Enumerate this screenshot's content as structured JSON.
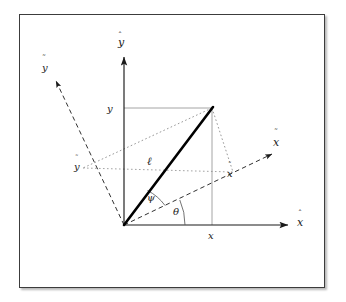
{
  "figure": {
    "type": "vector-diagram",
    "background_color": "#ffffff",
    "frame_border_color": "#3c3c3c",
    "axis_color": "#1a1a1a",
    "vector_color": "#000000",
    "projection_color": "#8a8a8a",
    "labels": {
      "axis_x_hat": "x",
      "axis_y_hat": "y",
      "axis_x_tilde": "x",
      "axis_y_tilde": "y",
      "component_x": "x",
      "component_y": "y",
      "component_x_tilde": "x",
      "component_y_tilde": "y",
      "vector_length": "ℓ",
      "angle_theta": "θ",
      "angle_psi": "ψ",
      "hat_accent": "ˆ",
      "tilde_accent": "˜"
    },
    "geometry": {
      "origin": [
        124,
        225
      ],
      "point_p": [
        212,
        108
      ],
      "x_hat_axis_tip": [
        292,
        225
      ],
      "y_hat_axis_tip": [
        124,
        52
      ],
      "x_tilde_axis_tip": [
        277,
        150
      ],
      "y_tilde_axis_tip": [
        51,
        75
      ],
      "x_tilde_foot": [
        233,
        172
      ],
      "y_tilde_foot": [
        83,
        168
      ],
      "rotation_angle_deg": 24,
      "vector_angle_deg": 53
    }
  }
}
